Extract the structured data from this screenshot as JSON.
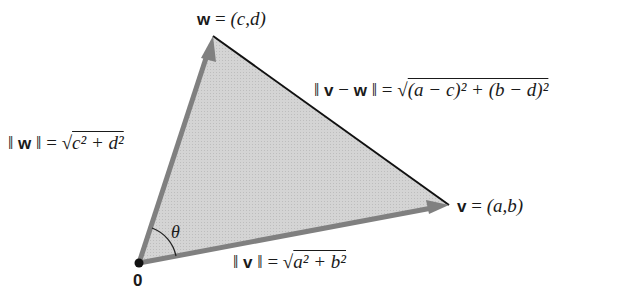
{
  "diagram": {
    "points": {
      "origin": {
        "label": "0",
        "x": 139,
        "y": 263
      },
      "w": {
        "x": 213,
        "y": 36
      },
      "v": {
        "x": 449,
        "y": 205
      }
    },
    "colors": {
      "fill": "#d0d0d0",
      "vector_stroke": "#808080",
      "edge_stroke": "#111111",
      "text": "#1a1a1a"
    },
    "labels": {
      "w_name": "w",
      "w_eq": "=",
      "w_coords": "(c,d)",
      "v_name": "v",
      "v_eq": "=",
      "v_coords": "(a,b)",
      "origin": "0",
      "theta": "θ",
      "norm_w_left": "‖",
      "norm_w_var": "w",
      "norm_w_right": "‖ = √",
      "norm_w_expr": "c² + d²",
      "norm_v_left": "‖",
      "norm_v_var": "v",
      "norm_v_right": "‖ = √",
      "norm_v_expr": "a² + b²",
      "dist_left": "‖",
      "dist_v": "v",
      "dist_minus": "−",
      "dist_w": "w",
      "dist_right": "‖ = √",
      "dist_expr": "(a − c)² + (b − d)²"
    }
  }
}
